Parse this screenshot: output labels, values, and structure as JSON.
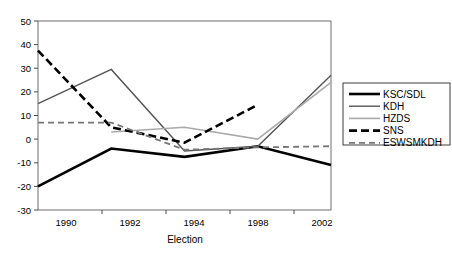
{
  "chart_data": {
    "type": "line",
    "title": "",
    "xlabel": "Election",
    "ylabel": "",
    "categories": [
      "1990",
      "1992",
      "1994",
      "1998",
      "2002"
    ],
    "ylim": [
      -30,
      50
    ],
    "yticks": [
      "50",
      "40",
      "30",
      "20",
      "10",
      "0",
      "-10",
      "-20",
      "-30"
    ],
    "ytick_values": [
      50,
      40,
      30,
      20,
      10,
      0,
      -10,
      -20,
      -30
    ],
    "grid": false,
    "legend_position": "right",
    "series": [
      {
        "name": "KSC/SDL",
        "values": [
          -20,
          -4,
          -7.5,
          -3,
          -11
        ],
        "color": "#000000",
        "style": "solid",
        "width": 2.6
      },
      {
        "name": "KDH",
        "values": [
          15,
          29.5,
          -5,
          -3,
          27
        ],
        "color": "#555555",
        "style": "solid",
        "width": 1.4
      },
      {
        "name": "HZDS",
        "values": [
          null,
          3,
          5,
          0,
          24
        ],
        "color": "#aaaaaa",
        "style": "solid",
        "width": 1.6
      },
      {
        "name": "SNS",
        "values": [
          37.5,
          5,
          -1.5,
          14.5,
          null
        ],
        "color": "#000000",
        "style": "dashed",
        "width": 2.6
      },
      {
        "name": "ESWSMKDH",
        "values": [
          7,
          7,
          -4.5,
          -3.5,
          -3
        ],
        "color": "#777777",
        "style": "dashed",
        "width": 1.8
      }
    ]
  },
  "legend": {
    "items": [
      {
        "label": "KSC/SDL"
      },
      {
        "label": "KDH"
      },
      {
        "label": "HZDS"
      },
      {
        "label": "SNS"
      },
      {
        "label": "ESWSMKDH"
      }
    ]
  },
  "axes": {
    "x_title": "Election",
    "x_labels": [
      "1990",
      "1992",
      "1994",
      "1998",
      "2002"
    ],
    "y_labels": [
      "50",
      "40",
      "30",
      "20",
      "10",
      "0",
      "-10",
      "-20",
      "-30"
    ]
  }
}
